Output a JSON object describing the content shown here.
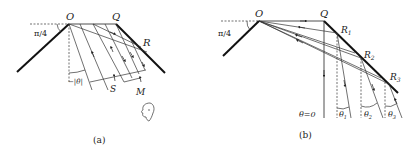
{
  "panels": [
    {
      "id": "a",
      "caption": "(a)",
      "labels": {
        "O": "O",
        "Q": "Q",
        "R": "R",
        "S": "S",
        "M": "M",
        "angle_wall": "π/4",
        "angle_theta": "−|θ|"
      },
      "elements": [
        "left-mirror",
        "right-mirror",
        "horizontal-ray-OQ",
        "parallel-rays",
        "observer-face"
      ]
    },
    {
      "id": "b",
      "caption": "(b)",
      "labels": {
        "O": "O",
        "Q": "Q",
        "R1": "R",
        "R1_sub": "1",
        "R2": "R",
        "R2_sub": "2",
        "R3": "R",
        "R3_sub": "3",
        "angle_wall": "π/4",
        "theta0": "θ=0",
        "theta1": "θ",
        "theta1_sub": "1",
        "theta2": "θ",
        "theta2_sub": "2",
        "theta3": "θ",
        "theta3_sub": "3"
      },
      "elements": [
        "left-mirror",
        "right-mirror",
        "rays-from-O",
        "reflected-rays",
        "vertical-reference-dashes"
      ]
    }
  ]
}
